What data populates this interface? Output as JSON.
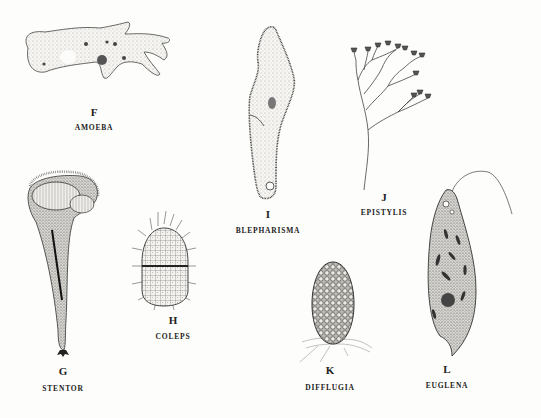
{
  "specimens": [
    {
      "letter": "F",
      "name": "AMOEBA"
    },
    {
      "letter": "I",
      "name": "BLEPHARISMA"
    },
    {
      "letter": "J",
      "name": "EPISTYLIS"
    },
    {
      "letter": "G",
      "name": "STENTOR"
    },
    {
      "letter": "H",
      "name": "COLEPS"
    },
    {
      "letter": "K",
      "name": "DIFFLUGIA"
    },
    {
      "letter": "L",
      "name": "EUGLENA"
    }
  ]
}
